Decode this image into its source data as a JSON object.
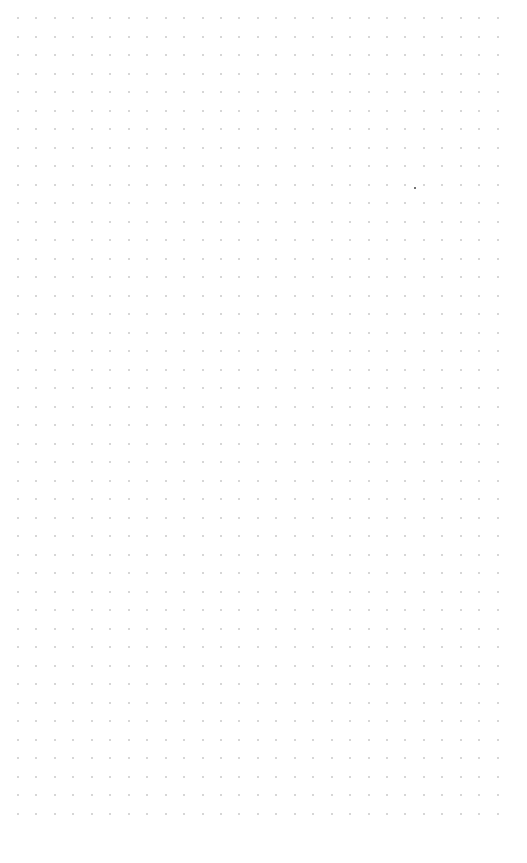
{
  "page": {
    "type": "dot-grid-paper",
    "background": "#ffffff"
  },
  "grid": {
    "origin_x": 17,
    "origin_y": 17,
    "spacing_x": 18.45,
    "spacing_y": 18.5,
    "columns": 27,
    "rows": 44,
    "dot_color": "#c8c8c8",
    "dot_size": 2
  },
  "marks": [
    {
      "x": 414,
      "y": 187,
      "color": "#444444",
      "size": 2
    }
  ]
}
